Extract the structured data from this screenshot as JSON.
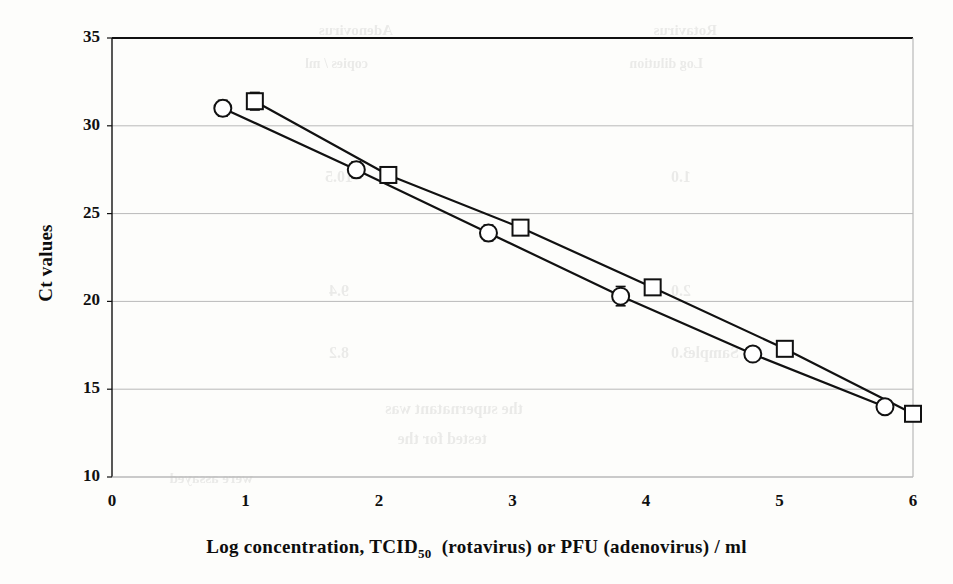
{
  "figure": {
    "background_color": "#fdfdfb",
    "ink_color": "#111111",
    "gridline_color": "#b9b9b9"
  },
  "axes": {
    "y_title": "Ct values",
    "x_title_parts": {
      "lead": "Log  concentration,  TCID",
      "subscript": "50",
      "tail_a": " (rotavirus)  or  PFU  (adenovirus)  /  ml"
    },
    "y_ticks": [
      "35",
      "30",
      "25",
      "20",
      "15",
      "10"
    ],
    "x_ticks": [
      "0",
      "1",
      "2",
      "3",
      "4",
      "5",
      "6"
    ]
  },
  "bleed_through_text": [
    {
      "text": "Rotavirus",
      "x": 236,
      "y": 22,
      "size": 15
    },
    {
      "text": "Adenovirus",
      "x": 560,
      "y": 22,
      "size": 15
    },
    {
      "text": "Log dilution",
      "x": 250,
      "y": 56,
      "size": 14
    },
    {
      "text": "copies / ml",
      "x": 585,
      "y": 56,
      "size": 14
    },
    {
      "text": "1.0",
      "x": 262,
      "y": 168,
      "size": 16
    },
    {
      "text": "10.5",
      "x": 600,
      "y": 168,
      "size": 16
    },
    {
      "text": "2.0",
      "x": 262,
      "y": 282,
      "size": 16
    },
    {
      "text": "9.4",
      "x": 604,
      "y": 282,
      "size": 16
    },
    {
      "text": "3.0",
      "x": 262,
      "y": 344,
      "size": 16
    },
    {
      "text": "8.2",
      "x": 604,
      "y": 344,
      "size": 16
    },
    {
      "text": "Sample",
      "x": 214,
      "y": 344,
      "size": 16
    },
    {
      "text": "the supernatant was",
      "x": 430,
      "y": 400,
      "size": 16
    },
    {
      "text": "tested for the",
      "x": 466,
      "y": 430,
      "size": 16
    },
    {
      "text": "were assayed",
      "x": 700,
      "y": 470,
      "size": 15
    }
  ],
  "chart_data": {
    "type": "line",
    "title": "",
    "xlabel": "Log concentration, TCID50 (rotavirus) or PFU (adenovirus) / ml",
    "ylabel": "Ct values",
    "xlim": [
      0,
      6
    ],
    "ylim": [
      10,
      35
    ],
    "x_tick_step": 1,
    "y_tick_step": 5,
    "grid": "horizontal",
    "legend": "none",
    "error_bars": "standard deviation, vertical",
    "series": [
      {
        "name": "rotavirus",
        "marker": "open-circle",
        "points": [
          {
            "x": 0.83,
            "y": 31.0,
            "err": 0.45
          },
          {
            "x": 1.83,
            "y": 27.5,
            "err": 0.45
          },
          {
            "x": 2.82,
            "y": 23.9,
            "err": 0.45
          },
          {
            "x": 3.81,
            "y": 20.3,
            "err": 0.55
          },
          {
            "x": 4.8,
            "y": 17.0,
            "err": 0.3
          },
          {
            "x": 5.79,
            "y": 14.0,
            "err": 0.25
          }
        ]
      },
      {
        "name": "adenovirus",
        "marker": "open-square",
        "points": [
          {
            "x": 1.07,
            "y": 31.4,
            "err": 0.5
          },
          {
            "x": 2.07,
            "y": 27.2,
            "err": 0.22
          },
          {
            "x": 3.06,
            "y": 24.2,
            "err": 0.2
          },
          {
            "x": 4.05,
            "y": 20.8,
            "err": 0.22
          },
          {
            "x": 5.04,
            "y": 17.3,
            "err": 0.22
          },
          {
            "x": 6.0,
            "y": 13.6,
            "err": 0.3
          }
        ]
      }
    ]
  }
}
